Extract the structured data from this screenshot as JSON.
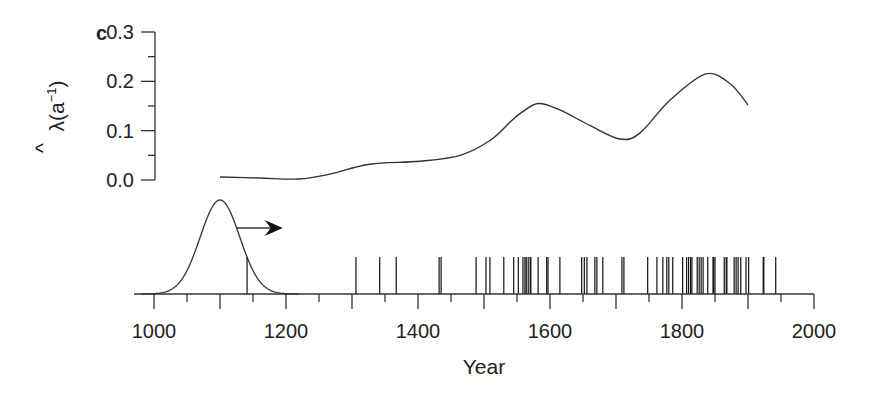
{
  "chart_data": {
    "type": "line",
    "panel_label": "c",
    "title": "",
    "xlabel": "Year",
    "ylabel": "λ̂(a⁻¹)",
    "ylabel_parts": {
      "symbol": "λ",
      "hat": "^",
      "unit": "(a",
      "sup": "−1",
      "close": ")"
    },
    "xlim": [
      1000,
      2000
    ],
    "ylim": [
      0.0,
      0.3
    ],
    "x_ticks_labeled": [
      1000,
      1200,
      1400,
      1600,
      1800,
      2000
    ],
    "x_ticks_major": [
      1000,
      1100,
      1200,
      1300,
      1400,
      1500,
      1600,
      1700,
      1800,
      1900,
      2000
    ],
    "x_ticks_minor": [
      1050,
      1150,
      1250,
      1350,
      1450,
      1550,
      1650,
      1750,
      1850,
      1950
    ],
    "y_ticks_labeled": [
      "0.0",
      "0.1",
      "0.2",
      "0.3"
    ],
    "y_tick_values": [
      0.0,
      0.1,
      0.2,
      0.3
    ],
    "y_ticks_minor": [
      0.05,
      0.15,
      0.25
    ],
    "grid": false,
    "legend": null,
    "series": [
      {
        "name": "estimated occurrence rate",
        "x": [
          1100,
          1160,
          1220,
          1267,
          1327,
          1403,
          1464,
          1509,
          1540,
          1555,
          1582,
          1615,
          1661,
          1706,
          1736,
          1782,
          1836,
          1873,
          1900
        ],
        "values": [
          0.006,
          0.004,
          0.002,
          0.012,
          0.032,
          0.038,
          0.05,
          0.08,
          0.118,
          0.135,
          0.155,
          0.142,
          0.11,
          0.083,
          0.095,
          0.162,
          0.215,
          0.195,
          0.152
        ]
      }
    ],
    "kernel": {
      "type": "gaussian",
      "center": 1100,
      "sigma": 30,
      "arrow": {
        "from": 1125,
        "to": 1195,
        "direction": "right"
      }
    },
    "events": [
      1141,
      1306,
      1342,
      1367,
      1432,
      1435,
      1488,
      1503,
      1509,
      1530,
      1545,
      1552,
      1559,
      1562,
      1564,
      1567,
      1570,
      1571,
      1582,
      1595,
      1597,
      1615,
      1648,
      1652,
      1656,
      1668,
      1671,
      1680,
      1709,
      1712,
      1748,
      1762,
      1771,
      1777,
      1780,
      1786,
      1801,
      1807,
      1810,
      1813,
      1815,
      1823,
      1826,
      1829,
      1832,
      1839,
      1847,
      1848,
      1850,
      1864,
      1867,
      1868,
      1879,
      1882,
      1885,
      1889,
      1897,
      1901,
      1923,
      1924,
      1942
    ],
    "colors": {
      "line": "#333333",
      "text": "#222222",
      "background": "#ffffff"
    }
  }
}
